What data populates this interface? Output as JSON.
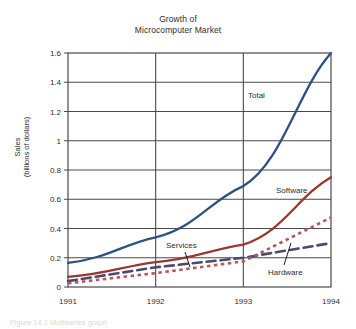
{
  "figure": {
    "title_line1": "Growth of",
    "title_line2": "Microcomputer Market",
    "caption": "Figure 14.1  Multiseries graph"
  },
  "chart_data": {
    "type": "line",
    "title": "Growth of Microcomputer Market",
    "xlabel": "",
    "ylabel": "Sales (billions of dollars)",
    "ylabel_line1": "Sales",
    "ylabel_line2": "(billions of dollars)",
    "x": [
      "1991",
      "1992",
      "1993",
      "1994"
    ],
    "xtick_labels": [
      "1991",
      "1992",
      "1993",
      "1994"
    ],
    "ytick_labels": [
      "0",
      "0.2",
      "0.4",
      "0.6",
      "0.8",
      "1",
      "1.2",
      "1.4",
      "1.6"
    ],
    "ytick_values": [
      0,
      0.2,
      0.4,
      0.6,
      0.8,
      1,
      1.2,
      1.4,
      1.6
    ],
    "ylim": [
      0,
      1.6
    ],
    "grid": "horizontal-and-vertical",
    "legend": "inline-labels",
    "series": [
      {
        "name": "Total",
        "label": "Total",
        "style": "solid",
        "color": "#2d5182",
        "values": [
          0.165,
          0.34,
          0.69,
          1.6
        ]
      },
      {
        "name": "Software",
        "label": "Software",
        "style": "solid",
        "color": "#9a382f",
        "values": [
          0.07,
          0.17,
          0.29,
          0.75
        ]
      },
      {
        "name": "Services",
        "label": "Services",
        "style": "dashed",
        "color": "#4a4a6e",
        "values": [
          0.04,
          0.135,
          0.2,
          0.3
        ]
      },
      {
        "name": "Hardware",
        "label": "Hardware",
        "style": "dotted",
        "color": "#b8565c",
        "values": [
          0.025,
          0.095,
          0.175,
          0.475
        ]
      }
    ]
  }
}
